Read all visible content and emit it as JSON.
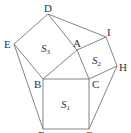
{
  "diagram": {
    "vertices": [
      "A",
      "B",
      "C",
      "D",
      "E",
      "F",
      "G",
      "H",
      "I"
    ],
    "squares": [
      {
        "name": "S1",
        "symbol": "S",
        "subscript": "1",
        "vertices": [
          "B",
          "C",
          "G",
          "F"
        ]
      },
      {
        "name": "S2",
        "symbol": "S",
        "subscript": "2",
        "vertices": [
          "A",
          "I",
          "H",
          "C"
        ]
      },
      {
        "name": "S3",
        "symbol": "S",
        "subscript": "3",
        "vertices": [
          "D",
          "A",
          "B",
          "E"
        ]
      }
    ],
    "segments": [
      [
        "D",
        "E"
      ],
      [
        "E",
        "B"
      ],
      [
        "B",
        "A"
      ],
      [
        "A",
        "D"
      ],
      [
        "A",
        "I"
      ],
      [
        "I",
        "H"
      ],
      [
        "H",
        "C"
      ],
      [
        "C",
        "A"
      ],
      [
        "B",
        "C"
      ],
      [
        "C",
        "G"
      ],
      [
        "G",
        "F"
      ],
      [
        "F",
        "B"
      ],
      [
        "D",
        "I"
      ],
      [
        "E",
        "F"
      ],
      [
        "H",
        "G"
      ]
    ]
  }
}
